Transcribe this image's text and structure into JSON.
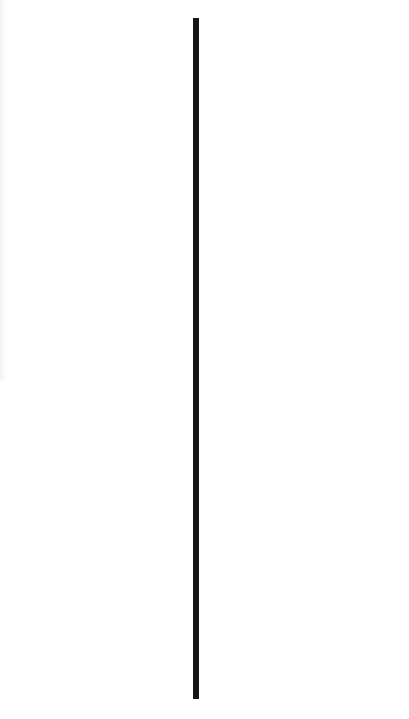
{
  "canvas": {
    "background": "#ffffff"
  },
  "divider": {
    "orientation": "vertical",
    "color": "#151515",
    "x": 193,
    "top": 18,
    "bottom": 699,
    "thickness": 6
  }
}
